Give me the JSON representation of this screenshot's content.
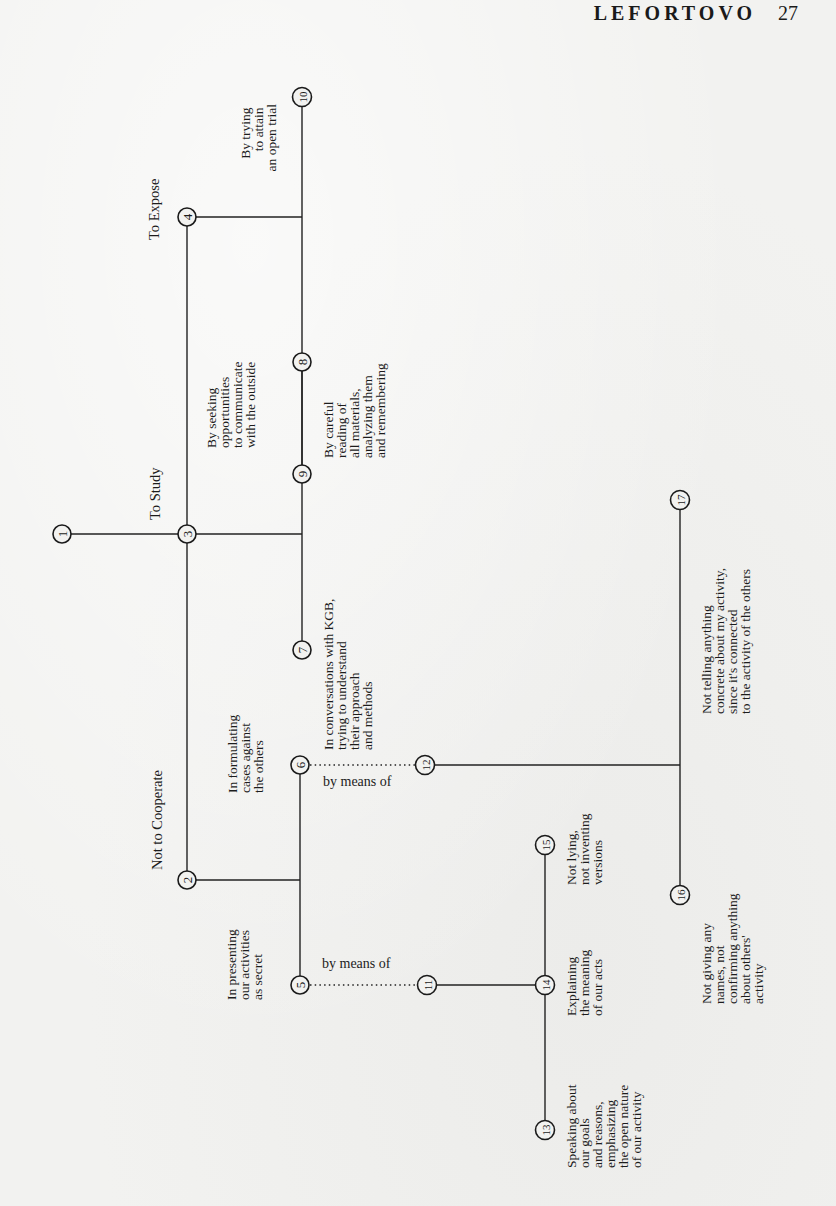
{
  "header": {
    "running_title": "LEFORTOVO",
    "page_number": "27"
  },
  "diagram": {
    "nodes": [
      {
        "id": "1",
        "x": 62,
        "y": 534
      },
      {
        "id": "2",
        "x": 187,
        "y": 880
      },
      {
        "id": "3",
        "x": 187,
        "y": 534
      },
      {
        "id": "4",
        "x": 187,
        "y": 217
      },
      {
        "id": "5",
        "x": 300,
        "y": 985
      },
      {
        "id": "6",
        "x": 300,
        "y": 765
      },
      {
        "id": "7",
        "x": 302,
        "y": 650
      },
      {
        "id": "8",
        "x": 302,
        "y": 362
      },
      {
        "id": "9",
        "x": 302,
        "y": 474
      },
      {
        "id": "10",
        "x": 302,
        "y": 97
      },
      {
        "id": "11",
        "x": 427,
        "y": 985
      },
      {
        "id": "12",
        "x": 425,
        "y": 765
      },
      {
        "id": "13",
        "x": 545,
        "y": 1130
      },
      {
        "id": "14",
        "x": 545,
        "y": 985
      },
      {
        "id": "15",
        "x": 545,
        "y": 845
      },
      {
        "id": "16",
        "x": 680,
        "y": 895
      },
      {
        "id": "17",
        "x": 680,
        "y": 500
      }
    ],
    "titles": {
      "to_expose": "To Expose",
      "to_study": "To Study",
      "not_to_cooperate": "Not to Cooperate"
    },
    "means_label": "by means of",
    "labels": {
      "n10": [
        "By trying",
        "to attain",
        "an open trial"
      ],
      "n9": [
        "By seeking",
        "opportunities",
        "to communicate",
        "with the outside"
      ],
      "n8": [
        "By careful",
        "reading of",
        "all materials,",
        "analyzing them",
        "and remembering"
      ],
      "n7": [
        "In conversations with KGB,",
        "trying to understand",
        "their approach",
        "and methods"
      ],
      "n6": [
        "In formulating",
        "cases against",
        "the others"
      ],
      "n5": [
        "In presenting",
        "our activities",
        "as secret"
      ],
      "n17": [
        "Not telling anything",
        "concrete about my activity,",
        "since it's connected",
        "to the activity of the others"
      ],
      "n16": [
        "Not giving any",
        "names, not",
        "confirming anything",
        "about others'",
        "activity"
      ],
      "n15": [
        "Not lying,",
        "not inventing",
        "versions"
      ],
      "n14": [
        "Explaining",
        "the meaning",
        "of our acts"
      ],
      "n13": [
        "Speaking about",
        "our goals",
        "and reasons,",
        "emphasizing",
        "the open nature",
        "of our activity"
      ]
    }
  }
}
